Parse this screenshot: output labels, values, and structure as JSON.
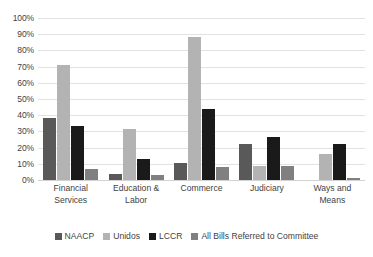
{
  "chart_data": {
    "type": "bar",
    "title": "",
    "subtitle": "",
    "xlabel": "",
    "ylabel": "",
    "ylim": [
      0,
      100
    ],
    "ytick_labels": [
      "100%",
      "90%",
      "80%",
      "70%",
      "60%",
      "50%",
      "40%",
      "30%",
      "20%",
      "10%",
      "0%"
    ],
    "ytick_values": [
      100,
      90,
      80,
      70,
      60,
      50,
      40,
      30,
      20,
      10,
      0
    ],
    "grid": true,
    "legend_position": "bottom",
    "categories": [
      "Financial Services",
      "Education & Labor",
      "Commerce",
      "Judiciary",
      "Ways and Means"
    ],
    "series": [
      {
        "name": "NAACP",
        "color": "#595959",
        "values": [
          38.5,
          4.0,
          10.5,
          22.0,
          0.0
        ]
      },
      {
        "name": "Unidos",
        "color": "#b3b3b3",
        "values": [
          71.0,
          31.5,
          88.5,
          8.5,
          16.0
        ]
      },
      {
        "name": "LCCR",
        "color": "#1a1a1a",
        "values": [
          33.5,
          13.0,
          44.0,
          26.5,
          22.0
        ]
      },
      {
        "name": "All Bills Referred to Committee",
        "color": "#808080",
        "values": [
          7.0,
          3.0,
          8.0,
          8.5,
          1.0
        ]
      }
    ]
  }
}
